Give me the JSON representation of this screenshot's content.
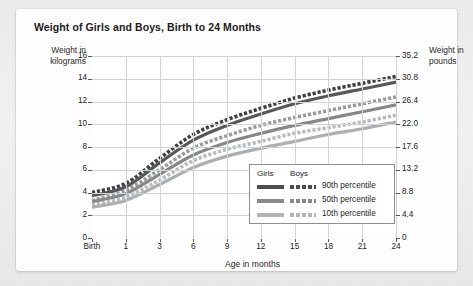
{
  "title": "Weight of Girls and Boys, Birth to 24 Months",
  "axis_titles": {
    "left": "Weight in kilograms",
    "right": "Weight in pounds",
    "bottom": "Age in months"
  },
  "legend": {
    "header_girls": "Girls",
    "header_boys": "Boys",
    "rows": [
      {
        "label": "90th percentile",
        "color": "#4d4d4f"
      },
      {
        "label": "50th percentile",
        "color": "#88898c"
      },
      {
        "label": "10th percentile",
        "color": "#b3b4b7"
      }
    ]
  },
  "chart_data": {
    "type": "line",
    "title": "Weight of Girls and Boys, Birth to 24 Months",
    "xlabel": "Age in months",
    "ylabel": "Weight in kilograms",
    "ylabel_secondary": "Weight in pounds",
    "grid": true,
    "legend_position": "inside-bottom-right",
    "x": [
      0,
      1,
      3,
      6,
      9,
      12,
      15,
      18,
      21,
      24
    ],
    "xtick_labels": [
      "Birth",
      "1",
      "3",
      "6",
      "9",
      "12",
      "15",
      "18",
      "21",
      "24"
    ],
    "xlim": [
      0,
      24
    ],
    "ylim": [
      0,
      16
    ],
    "ytick_labels": [
      "0",
      "2",
      "4",
      "6",
      "8",
      "10",
      "12",
      "14",
      "16"
    ],
    "ytick_values": [
      0,
      2,
      4,
      6,
      8,
      10,
      12,
      14,
      16
    ],
    "y2tick_labels": [
      "0",
      "4.4",
      "8.8",
      "13.2",
      "17.6",
      "22.0",
      "26.4",
      "30.8",
      "35.2"
    ],
    "y2tick_values": [
      0,
      4.4,
      8.8,
      13.2,
      17.6,
      22.0,
      26.4,
      30.8,
      35.2
    ],
    "series": [
      {
        "name": "Boys 90th percentile",
        "sex": "Boys",
        "percentile": 90,
        "style": "dashed",
        "color": "#3f3f41",
        "values": [
          4.0,
          4.8,
          7.0,
          9.1,
          10.4,
          11.4,
          12.3,
          13.0,
          13.6,
          14.2
        ]
      },
      {
        "name": "Girls 90th percentile",
        "sex": "Girls",
        "percentile": 90,
        "style": "solid",
        "color": "#57585a",
        "values": [
          3.7,
          4.5,
          6.6,
          8.6,
          9.9,
          10.9,
          11.8,
          12.5,
          13.1,
          13.7
        ]
      },
      {
        "name": "Boys 50th percentile",
        "sex": "Boys",
        "percentile": 50,
        "style": "dashed",
        "color": "#9a9b9e",
        "values": [
          3.3,
          4.2,
          6.0,
          7.9,
          9.0,
          9.9,
          10.6,
          11.2,
          11.8,
          12.4
        ]
      },
      {
        "name": "Girls 50th percentile",
        "sex": "Girls",
        "percentile": 50,
        "style": "solid",
        "color": "#86878a",
        "values": [
          3.2,
          3.9,
          5.6,
          7.3,
          8.4,
          9.2,
          9.9,
          10.5,
          11.1,
          11.7
        ]
      },
      {
        "name": "Boys 10th percentile",
        "sex": "Boys",
        "percentile": 10,
        "style": "dashed",
        "color": "#b9babd",
        "values": [
          2.9,
          3.6,
          5.1,
          6.8,
          7.8,
          8.5,
          9.2,
          9.7,
          10.2,
          10.8
        ]
      },
      {
        "name": "Girls 10th percentile",
        "sex": "Girls",
        "percentile": 10,
        "style": "solid",
        "color": "#adaeb1",
        "values": [
          2.7,
          3.3,
          4.7,
          6.2,
          7.2,
          7.9,
          8.5,
          9.1,
          9.6,
          10.2
        ]
      }
    ]
  }
}
